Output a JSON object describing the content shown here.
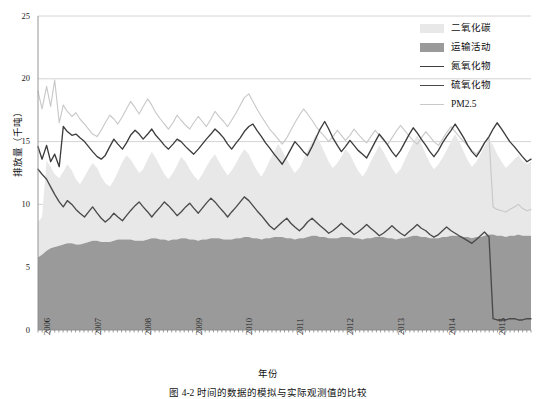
{
  "figure": {
    "caption": "图 4-2  时间的数据的模拟与实际观测值的比较",
    "background": "#ffffff"
  },
  "axes": {
    "y_title": "排放量（千吨）",
    "x_title": "年份",
    "y_ticks": [
      "0",
      "5",
      "10",
      "15",
      "20",
      "25"
    ],
    "x_ticks": [
      "2006",
      "2007",
      "2008",
      "2009",
      "2010",
      "2011",
      "2012",
      "2013",
      "2014",
      "2015"
    ]
  },
  "legend": {
    "items": [
      {
        "label": "二氧化碳",
        "color": "#e8e8e8",
        "kind": "area"
      },
      {
        "label": "运输活动",
        "color": "#9a9a9a",
        "kind": "area"
      },
      {
        "label": "氮氧化物",
        "color": "#3d3d3d",
        "kind": "line"
      },
      {
        "label": "硫氧化物",
        "color": "#4a4a4a",
        "kind": "line"
      },
      {
        "label": "PM2.5",
        "color": "#c9c9c9",
        "kind": "line"
      }
    ]
  },
  "colors": {
    "grid": "#cfcfcf",
    "axis": "#8a8a8a",
    "co2_area": "#e8e8e8",
    "transport_area": "#9a9a9a",
    "nox_line": "#3d3d3d",
    "sox_line": "#4a4a4a",
    "pm25_line": "#c9c9c9"
  },
  "chart_data": {
    "type": "area",
    "title": "",
    "xlabel": "年份",
    "ylabel": "排放量（千吨）",
    "xlim": [
      2006.0,
      2015.75
    ],
    "ylim": [
      0,
      25
    ],
    "ytick_values": [
      0,
      5,
      10,
      15,
      20,
      25
    ],
    "grid": "horizontal",
    "legend_position": "top-right",
    "x": [
      2006.0,
      2006.08,
      2006.17,
      2006.25,
      2006.33,
      2006.42,
      2006.5,
      2006.58,
      2006.67,
      2006.75,
      2006.83,
      2006.92,
      2007.0,
      2007.08,
      2007.17,
      2007.25,
      2007.33,
      2007.42,
      2007.5,
      2007.58,
      2007.67,
      2007.75,
      2007.83,
      2007.92,
      2008.0,
      2008.08,
      2008.17,
      2008.25,
      2008.33,
      2008.42,
      2008.5,
      2008.58,
      2008.67,
      2008.75,
      2008.83,
      2008.92,
      2009.0,
      2009.08,
      2009.17,
      2009.25,
      2009.33,
      2009.42,
      2009.5,
      2009.58,
      2009.67,
      2009.75,
      2009.83,
      2009.92,
      2010.0,
      2010.08,
      2010.17,
      2010.25,
      2010.33,
      2010.42,
      2010.5,
      2010.58,
      2010.67,
      2010.75,
      2010.83,
      2010.92,
      2011.0,
      2011.08,
      2011.17,
      2011.25,
      2011.33,
      2011.42,
      2011.5,
      2011.58,
      2011.67,
      2011.75,
      2011.83,
      2011.92,
      2012.0,
      2012.08,
      2012.17,
      2012.25,
      2012.33,
      2012.42,
      2012.5,
      2012.58,
      2012.67,
      2012.75,
      2012.83,
      2012.92,
      2013.0,
      2013.08,
      2013.17,
      2013.25,
      2013.33,
      2013.42,
      2013.5,
      2013.58,
      2013.67,
      2013.75,
      2013.83,
      2013.92,
      2014.0,
      2014.08,
      2014.17,
      2014.25,
      2014.33,
      2014.42,
      2014.5,
      2014.58,
      2014.67,
      2014.75,
      2014.83,
      2014.92,
      2015.0,
      2015.08,
      2015.17,
      2015.25,
      2015.33,
      2015.42,
      2015.5,
      2015.58,
      2015.67,
      2015.75
    ],
    "series": [
      {
        "name": "二氧化碳",
        "type": "area",
        "color": "#e8e8e8",
        "stacked_top": true,
        "values": [
          8.6,
          9.0,
          13.5,
          13.0,
          12.4,
          12.1,
          12.6,
          13.2,
          12.7,
          12.0,
          11.6,
          12.2,
          12.8,
          13.3,
          12.9,
          12.2,
          11.7,
          11.4,
          11.9,
          12.6,
          13.4,
          13.9,
          13.6,
          13.0,
          12.5,
          12.8,
          13.6,
          14.2,
          13.7,
          13.0,
          12.4,
          12.0,
          12.5,
          13.1,
          13.8,
          13.4,
          12.8,
          12.3,
          11.9,
          12.4,
          13.0,
          13.6,
          14.0,
          13.4,
          12.8,
          12.3,
          12.7,
          13.3,
          13.9,
          14.4,
          14.0,
          13.3,
          12.7,
          12.2,
          12.8,
          13.5,
          14.2,
          14.8,
          14.3,
          13.6,
          13.0,
          12.5,
          12.9,
          13.6,
          14.3,
          15.0,
          15.6,
          14.9,
          14.1,
          13.4,
          12.9,
          13.3,
          13.8,
          14.4,
          14.0,
          13.3,
          12.7,
          12.2,
          12.7,
          13.4,
          14.1,
          14.7,
          14.2,
          13.5,
          12.9,
          12.4,
          12.8,
          13.5,
          14.2,
          14.9,
          15.5,
          14.8,
          14.0,
          13.3,
          12.8,
          13.2,
          13.7,
          14.3,
          15.0,
          15.6,
          15.0,
          14.2,
          13.5,
          13.0,
          13.4,
          14.0,
          14.6,
          15.2,
          14.7,
          14.0,
          13.4,
          12.9,
          13.2,
          13.6,
          13.9,
          13.5,
          13.2,
          13.4
        ]
      },
      {
        "name": "运输活动",
        "type": "area",
        "color": "#9a9a9a",
        "stacked_base": true,
        "values": [
          5.8,
          6.0,
          6.3,
          6.5,
          6.6,
          6.7,
          6.8,
          6.9,
          6.9,
          6.8,
          6.8,
          6.9,
          7.0,
          7.1,
          7.1,
          7.0,
          7.0,
          7.0,
          7.1,
          7.2,
          7.2,
          7.2,
          7.2,
          7.1,
          7.1,
          7.1,
          7.2,
          7.3,
          7.3,
          7.2,
          7.2,
          7.1,
          7.2,
          7.2,
          7.3,
          7.3,
          7.2,
          7.2,
          7.1,
          7.2,
          7.2,
          7.3,
          7.3,
          7.3,
          7.2,
          7.2,
          7.2,
          7.3,
          7.3,
          7.4,
          7.4,
          7.3,
          7.3,
          7.2,
          7.3,
          7.3,
          7.4,
          7.4,
          7.4,
          7.3,
          7.3,
          7.2,
          7.3,
          7.3,
          7.4,
          7.5,
          7.5,
          7.4,
          7.4,
          7.3,
          7.3,
          7.3,
          7.4,
          7.4,
          7.4,
          7.3,
          7.3,
          7.2,
          7.3,
          7.3,
          7.4,
          7.4,
          7.4,
          7.3,
          7.3,
          7.2,
          7.3,
          7.3,
          7.4,
          7.5,
          7.5,
          7.4,
          7.4,
          7.3,
          7.3,
          7.3,
          7.4,
          7.4,
          7.5,
          7.5,
          7.5,
          7.4,
          7.4,
          7.3,
          7.4,
          7.4,
          7.5,
          7.6,
          7.6,
          7.5,
          7.5,
          7.4,
          7.5,
          7.5,
          7.6,
          7.5,
          7.5,
          7.5
        ]
      },
      {
        "name": "氮氧化物",
        "type": "line",
        "color": "#3d3d3d",
        "values": [
          14.6,
          13.6,
          14.7,
          13.4,
          14.0,
          13.0,
          16.2,
          15.8,
          15.5,
          15.6,
          15.3,
          15.0,
          14.6,
          14.2,
          13.8,
          13.6,
          13.9,
          14.6,
          15.2,
          14.8,
          14.4,
          14.9,
          15.5,
          15.9,
          15.6,
          15.2,
          15.6,
          16.0,
          15.5,
          15.1,
          14.7,
          14.4,
          14.8,
          15.2,
          15.0,
          14.6,
          14.3,
          14.0,
          14.4,
          14.8,
          15.2,
          15.6,
          16.0,
          15.7,
          15.3,
          14.8,
          14.4,
          14.9,
          15.3,
          15.8,
          16.2,
          16.4,
          15.9,
          15.4,
          14.9,
          14.5,
          14.0,
          13.6,
          13.2,
          13.8,
          14.4,
          15.0,
          14.6,
          14.2,
          13.9,
          14.6,
          15.3,
          16.0,
          16.6,
          16.0,
          15.3,
          14.7,
          14.2,
          14.6,
          15.1,
          14.7,
          14.3,
          14.0,
          13.7,
          14.3,
          15.0,
          15.6,
          15.2,
          14.7,
          14.2,
          13.8,
          14.3,
          14.9,
          15.5,
          16.1,
          15.7,
          15.2,
          14.7,
          14.2,
          13.8,
          14.3,
          14.9,
          15.4,
          15.9,
          16.4,
          15.9,
          15.3,
          14.7,
          14.2,
          13.8,
          14.3,
          14.9,
          15.4,
          16.0,
          16.5,
          16.0,
          15.5,
          15.0,
          14.6,
          14.2,
          13.8,
          13.4,
          13.6
        ]
      },
      {
        "name": "硫氧化物",
        "type": "line",
        "color": "#4a4a4a",
        "values": [
          12.8,
          12.4,
          12.0,
          11.4,
          10.8,
          10.2,
          9.8,
          10.3,
          10.0,
          9.6,
          9.3,
          9.0,
          9.4,
          9.8,
          9.3,
          8.9,
          8.6,
          8.9,
          9.3,
          9.0,
          8.7,
          9.1,
          9.5,
          9.9,
          10.2,
          9.8,
          9.4,
          9.0,
          9.4,
          9.8,
          10.2,
          9.9,
          9.5,
          9.1,
          9.4,
          9.8,
          10.1,
          9.7,
          9.3,
          9.7,
          10.1,
          10.5,
          10.2,
          9.8,
          9.4,
          9.0,
          9.4,
          9.8,
          10.2,
          10.6,
          10.3,
          9.9,
          9.5,
          9.1,
          8.7,
          8.3,
          8.0,
          8.3,
          8.6,
          8.9,
          8.5,
          8.2,
          7.9,
          8.2,
          8.6,
          8.9,
          8.6,
          8.3,
          8.0,
          7.7,
          7.9,
          8.2,
          8.5,
          8.2,
          7.9,
          7.6,
          7.8,
          8.1,
          8.4,
          8.1,
          7.8,
          7.5,
          7.7,
          8.0,
          8.3,
          8.0,
          7.7,
          7.5,
          7.8,
          8.1,
          8.4,
          8.1,
          7.9,
          7.6,
          7.4,
          7.6,
          7.9,
          8.2,
          7.9,
          7.7,
          7.5,
          7.3,
          7.1,
          6.9,
          7.2,
          7.5,
          7.8,
          7.4,
          0.9,
          0.8,
          0.8,
          0.8,
          0.9,
          0.9,
          0.8,
          0.8,
          0.9,
          0.9
        ]
      },
      {
        "name": "PM2.5",
        "type": "line",
        "color": "#c9c9c9",
        "values": [
          19.0,
          17.6,
          19.4,
          17.8,
          19.9,
          16.5,
          17.9,
          17.4,
          17.0,
          17.3,
          16.8,
          16.4,
          16.0,
          15.6,
          15.4,
          15.9,
          16.5,
          17.1,
          16.8,
          16.4,
          17.0,
          17.6,
          18.2,
          17.7,
          17.2,
          17.8,
          18.4,
          17.9,
          17.3,
          16.8,
          16.4,
          16.0,
          16.5,
          17.1,
          16.7,
          16.3,
          16.0,
          16.5,
          17.0,
          16.6,
          16.2,
          16.8,
          17.4,
          17.0,
          16.6,
          16.2,
          16.7,
          17.3,
          17.9,
          18.5,
          18.8,
          18.2,
          17.6,
          17.0,
          16.5,
          16.0,
          15.6,
          15.2,
          14.8,
          15.3,
          15.9,
          16.5,
          17.1,
          17.6,
          17.2,
          16.7,
          16.2,
          15.8,
          15.4,
          15.0,
          15.4,
          15.9,
          15.5,
          15.1,
          15.5,
          16.0,
          15.6,
          15.2,
          14.9,
          15.4,
          15.9,
          15.5,
          15.1,
          14.8,
          15.3,
          15.8,
          16.3,
          15.9,
          15.5,
          15.1,
          14.8,
          15.3,
          15.8,
          15.4,
          15.0,
          14.7,
          15.2,
          15.7,
          16.2,
          15.8,
          15.4,
          15.0,
          14.7,
          14.3,
          14.0,
          14.4,
          14.9,
          15.3,
          9.8,
          9.6,
          9.5,
          9.4,
          9.6,
          9.8,
          10.0,
          9.7,
          9.5,
          9.6
        ]
      }
    ]
  }
}
